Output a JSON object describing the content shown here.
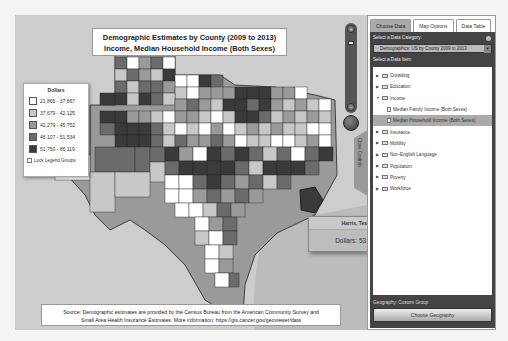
{
  "map": {
    "title_line1": "Demographic Estimates by County (2009 to 2013)",
    "title_line2": "Income, Median Household Income (Both Sexes)",
    "legend": {
      "title": "Dollars",
      "items": [
        {
          "range": "21,865 - 37,667",
          "color": "#ffffff"
        },
        {
          "range": "37,679 - 42,125",
          "color": "#c8c8c8"
        },
        {
          "range": "42,279 - 45,752",
          "color": "#9a9a9a"
        },
        {
          "range": "46,107 - 51,534",
          "color": "#6b6b6b"
        },
        {
          "range": "51,750 - 86,119",
          "color": "#3a3a3a"
        }
      ],
      "lock_label": "Lock Legend Groups"
    },
    "source_line1": "Source: Demographic estimates are provided by the Census Bureau from the American Community Survey and",
    "source_line2": "Small Area Health Insurance Estimates.  More information: https://gis.cancer.gov/geoviewer/data",
    "close_controls_label": "Close Controls",
    "tooltip": {
      "county": "Harris, Texas",
      "value_label": "Dollars: 53,137"
    },
    "zoom_plus": "+",
    "zoom_minus": "−"
  },
  "panel": {
    "tabs": [
      {
        "label": "Choose Data",
        "active": true
      },
      {
        "label": "Map Options",
        "active": false
      },
      {
        "label": "Data Table",
        "active": false
      }
    ],
    "category_label": "Select a Data Category:",
    "category_value": "Demographics: US by County 2009 to 2013",
    "item_label": "Select a Data Item:",
    "tree": [
      {
        "label": "Crowding",
        "expanded": false
      },
      {
        "label": "Education",
        "expanded": false
      },
      {
        "label": "Income",
        "expanded": true
      },
      {
        "label": "Median Family Income (Both Sexes)",
        "child": true
      },
      {
        "label": "Median Household Income (Both Sexes)",
        "child": true,
        "selected": true
      },
      {
        "label": "Insurance",
        "expanded": false
      },
      {
        "label": "Mobility",
        "expanded": false
      },
      {
        "label": "Non-English Language",
        "expanded": false
      },
      {
        "label": "Population",
        "expanded": false
      },
      {
        "label": "Poverty",
        "expanded": false
      },
      {
        "label": "Workforce",
        "expanded": false
      }
    ],
    "geography_label": "Geography: Custom Group",
    "choose_geography": "Choose Geography"
  }
}
